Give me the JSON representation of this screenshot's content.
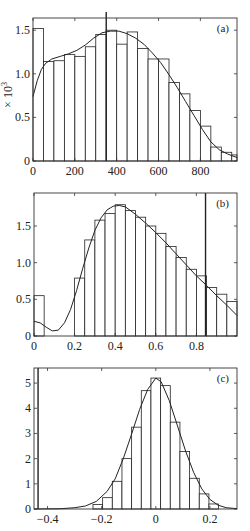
{
  "chart_data": [
    {
      "type": "bar",
      "panel_label": "(a)",
      "ylabel": "× 10³",
      "xlim": [
        0,
        975
      ],
      "ylim": [
        0,
        1.64
      ],
      "xticks": [
        0,
        200,
        400,
        600,
        800
      ],
      "xtick_labels": [
        "0",
        "200",
        "400",
        "600",
        "800"
      ],
      "yticks": [
        0,
        0.5,
        1.0,
        1.5
      ],
      "ytick_labels": [
        "0",
        "0.5",
        "1.0",
        "1.5"
      ],
      "bin_width": 50,
      "bin_start": 0,
      "values": [
        1.52,
        1.14,
        1.15,
        1.22,
        1.2,
        1.31,
        1.45,
        1.5,
        1.34,
        1.48,
        1.29,
        1.17,
        1.17,
        0.9,
        0.77,
        0.58,
        0.4,
        0.16,
        0.1,
        0.07
      ],
      "fit_curve": [
        [
          0,
          0.74
        ],
        [
          20,
          0.92
        ],
        [
          40,
          1.05
        ],
        [
          60,
          1.12
        ],
        [
          90,
          1.17
        ],
        [
          130,
          1.2
        ],
        [
          170,
          1.23
        ],
        [
          210,
          1.27
        ],
        [
          250,
          1.33
        ],
        [
          290,
          1.41
        ],
        [
          330,
          1.47
        ],
        [
          370,
          1.49
        ],
        [
          410,
          1.49
        ],
        [
          450,
          1.46
        ],
        [
          490,
          1.41
        ],
        [
          530,
          1.34
        ],
        [
          570,
          1.24
        ],
        [
          610,
          1.13
        ],
        [
          650,
          0.99
        ],
        [
          690,
          0.84
        ],
        [
          730,
          0.68
        ],
        [
          770,
          0.52
        ],
        [
          810,
          0.36
        ],
        [
          850,
          0.22
        ],
        [
          890,
          0.13
        ],
        [
          930,
          0.08
        ],
        [
          975,
          0.04
        ]
      ],
      "vline_x": 350,
      "grid": false
    },
    {
      "type": "bar",
      "panel_label": "(b)",
      "xlim": [
        0,
        1.0
      ],
      "ylim": [
        0,
        1.95
      ],
      "xticks": [
        0,
        0.2,
        0.4,
        0.6,
        0.8
      ],
      "xtick_labels": [
        "0",
        "0.2",
        "0.4",
        "0.6",
        "0.8"
      ],
      "yticks": [
        0,
        0.5,
        1.0,
        1.5
      ],
      "ytick_labels": [
        "0",
        "0.5",
        "1.0",
        "1.5"
      ],
      "bin_width": 0.05,
      "bin_start": 0,
      "values": [
        0.55,
        0,
        0,
        0,
        0.79,
        1.31,
        1.58,
        1.67,
        1.79,
        1.71,
        1.62,
        1.5,
        1.4,
        1.22,
        1.07,
        0.91,
        0.82,
        0.66,
        0.57,
        0.47
      ],
      "fit_curve": [
        [
          0,
          0.2
        ],
        [
          0.03,
          0.18
        ],
        [
          0.06,
          0.12
        ],
        [
          0.09,
          0.07
        ],
        [
          0.12,
          0.08
        ],
        [
          0.15,
          0.18
        ],
        [
          0.18,
          0.36
        ],
        [
          0.21,
          0.62
        ],
        [
          0.24,
          0.92
        ],
        [
          0.27,
          1.2
        ],
        [
          0.3,
          1.44
        ],
        [
          0.33,
          1.61
        ],
        [
          0.36,
          1.72
        ],
        [
          0.39,
          1.77
        ],
        [
          0.42,
          1.78
        ],
        [
          0.45,
          1.76
        ],
        [
          0.5,
          1.66
        ],
        [
          0.55,
          1.54
        ],
        [
          0.6,
          1.41
        ],
        [
          0.65,
          1.27
        ],
        [
          0.7,
          1.12
        ],
        [
          0.75,
          0.97
        ],
        [
          0.8,
          0.82
        ],
        [
          0.85,
          0.69
        ],
        [
          0.9,
          0.55
        ],
        [
          0.95,
          0.42
        ],
        [
          1.0,
          0.28
        ]
      ],
      "vline_x": 0.845,
      "grid": false
    },
    {
      "type": "bar",
      "panel_label": "(c)",
      "xlim": [
        -0.45,
        0.3
      ],
      "ylim": [
        0,
        5.6
      ],
      "xticks": [
        -0.4,
        -0.2,
        0,
        0.2
      ],
      "xtick_labels": [
        "−0.4",
        "−0.2",
        "0",
        "0.2"
      ],
      "yticks": [
        0,
        1,
        2,
        3,
        4,
        5
      ],
      "ytick_labels": [
        "0",
        "1",
        "2",
        "3",
        "4",
        "5"
      ],
      "bin_width": 0.0357,
      "bin_start": -0.2321,
      "values": [
        0.18,
        0.45,
        1.1,
        2.0,
        3.25,
        4.7,
        5.2,
        4.9,
        3.45,
        2.28,
        1.22,
        0.6,
        0.2
      ],
      "fit_curve": [
        [
          -0.45,
          0
        ],
        [
          -0.35,
          0.01
        ],
        [
          -0.3,
          0.05
        ],
        [
          -0.26,
          0.12
        ],
        [
          -0.22,
          0.3
        ],
        [
          -0.18,
          0.7
        ],
        [
          -0.15,
          1.2
        ],
        [
          -0.12,
          2.0
        ],
        [
          -0.09,
          2.95
        ],
        [
          -0.06,
          3.95
        ],
        [
          -0.03,
          4.75
        ],
        [
          0,
          5.2
        ],
        [
          0.02,
          5.05
        ],
        [
          0.05,
          4.3
        ],
        [
          0.08,
          3.3
        ],
        [
          0.11,
          2.3
        ],
        [
          0.14,
          1.45
        ],
        [
          0.17,
          0.8
        ],
        [
          0.2,
          0.38
        ],
        [
          0.23,
          0.15
        ],
        [
          0.26,
          0.05
        ],
        [
          0.3,
          0.01
        ]
      ],
      "vline_x": -0.435,
      "grid": false
    }
  ],
  "layout": {
    "panels": [
      {
        "x0": 33,
        "y0": 18,
        "x1": 237,
        "y1": 161
      },
      {
        "x0": 34,
        "y0": 193,
        "x1": 237,
        "y1": 336
      },
      {
        "x0": 34,
        "y0": 368,
        "x1": 237,
        "y1": 509
      }
    ],
    "colors": {
      "line": "#222222",
      "bar_fill": "#ffffff",
      "axis": "#333333"
    }
  }
}
